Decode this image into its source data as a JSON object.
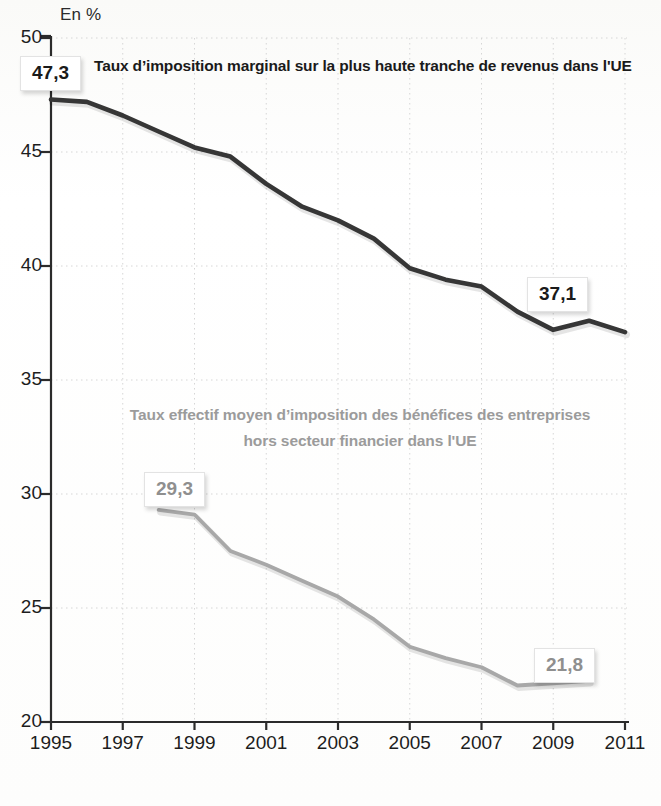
{
  "axis": {
    "unit_label": "En %",
    "y_ticks": [
      "20",
      "25",
      "30",
      "35",
      "40",
      "45",
      "50"
    ],
    "x_ticks": [
      "1995",
      "1997",
      "1999",
      "2001",
      "2003",
      "2005",
      "2007",
      "2009",
      "2011"
    ]
  },
  "labels": {
    "series1_title": "Taux d’imposition marginal sur la plus haute tranche de revenus dans l'UE",
    "series2_title_line1": "Taux effectif moyen d’imposition des bénéfices des entreprises",
    "series2_title_line2": "hors secteur financier dans l'UE",
    "series1_start_value": "47,3",
    "series1_end_value": "37,1",
    "series2_start_value": "29,3",
    "series2_end_value": "21,8"
  },
  "colors": {
    "series1": "#363636",
    "series2": "#a8a8a8",
    "axis": "#2b2b2b",
    "grid": "#d6d6d6",
    "background": "#fdfdfc"
  },
  "chart_data": {
    "type": "line",
    "title": "Taux d’imposition marginal sur la plus haute tranche de revenus dans l'UE",
    "xlabel": "",
    "ylabel": "En %",
    "xlim": [
      1995,
      2011
    ],
    "ylim": [
      20,
      50
    ],
    "yticks": [
      20,
      25,
      30,
      35,
      40,
      45,
      50
    ],
    "xticks": [
      1995,
      1997,
      1999,
      2001,
      2003,
      2005,
      2007,
      2009,
      2011
    ],
    "grid": true,
    "grid_style": "dotted",
    "legend": "inline-annotations",
    "annotations": [
      {
        "text": "47,3",
        "series": "Taux d’imposition marginal sur la plus haute tranche de revenus dans l'UE",
        "x": 1995,
        "y": 47.3
      },
      {
        "text": "37,1",
        "series": "Taux d’imposition marginal sur la plus haute tranche de revenus dans l'UE",
        "x": 2011,
        "y": 37.1
      },
      {
        "text": "29,3",
        "series": "Taux effectif moyen d’imposition des bénéfices des entreprises hors secteur financier dans l'UE",
        "x": 1998,
        "y": 29.3
      },
      {
        "text": "21,8",
        "series": "Taux effectif moyen d’imposition des bénéfices des entreprises hors secteur financier dans l'UE",
        "x": 2010,
        "y": 21.8
      }
    ],
    "series": [
      {
        "name": "Taux d’imposition marginal sur la plus haute tranche de revenus dans l'UE",
        "color": "#363636",
        "x": [
          1995,
          1996,
          1997,
          1998,
          1999,
          2000,
          2001,
          2002,
          2003,
          2004,
          2005,
          2006,
          2007,
          2008,
          2009,
          2010,
          2011
        ],
        "values": [
          47.3,
          47.2,
          46.6,
          45.9,
          45.2,
          44.8,
          43.6,
          42.6,
          42.0,
          41.2,
          39.9,
          39.4,
          39.1,
          38.0,
          37.2,
          37.6,
          37.1
        ]
      },
      {
        "name": "Taux effectif moyen d’imposition des bénéfices des entreprises hors secteur financier dans l'UE",
        "color": "#a8a8a8",
        "x": [
          1998,
          1999,
          2000,
          2001,
          2002,
          2003,
          2004,
          2005,
          2006,
          2007,
          2008,
          2009,
          2010
        ],
        "values": [
          29.3,
          29.1,
          27.5,
          26.9,
          26.2,
          25.5,
          24.5,
          23.3,
          22.8,
          22.4,
          21.6,
          21.7,
          21.8
        ]
      }
    ]
  }
}
